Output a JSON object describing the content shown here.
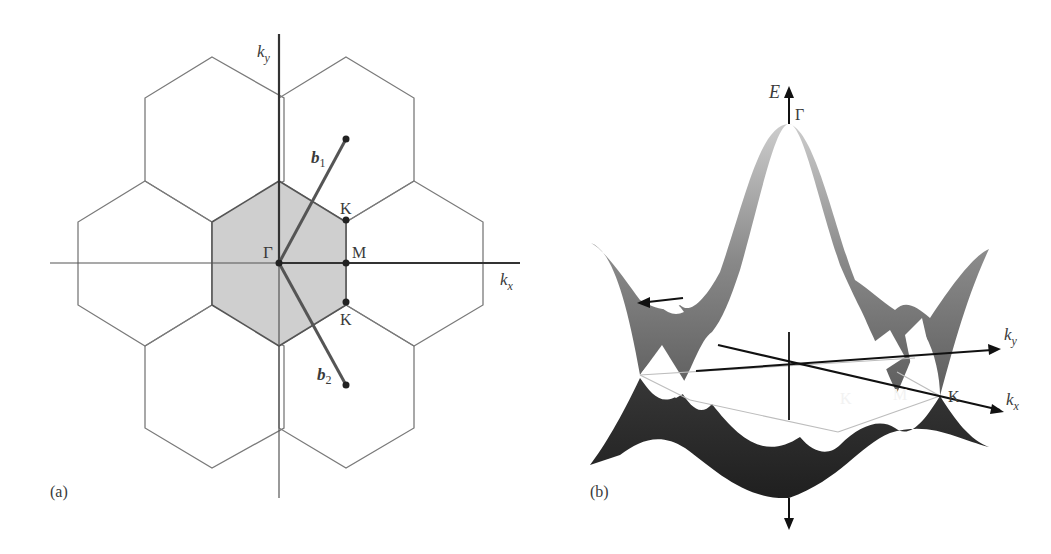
{
  "figure": {
    "panel_a": {
      "label": "(a)",
      "axes": {
        "x_label": "k",
        "x_sub": "x",
        "y_label": "k",
        "y_sub": "y"
      },
      "points": {
        "gamma": "Γ",
        "m": "M",
        "k_upper": "K",
        "k_lower": "K"
      },
      "vectors": [
        {
          "name": "b",
          "sub": "1"
        },
        {
          "name": "b",
          "sub": "2"
        }
      ],
      "colors": {
        "brillouin_zone_fill": "#cfcfcf",
        "hex_stroke": "#6e6e6e",
        "axis": "#333333",
        "vector": "#555555"
      }
    },
    "panel_b": {
      "label": "(b)",
      "axes": {
        "energy_label": "E",
        "x_label": "k",
        "x_sub": "x",
        "y_label": "k",
        "y_sub": "y"
      },
      "points": {
        "gamma": "Γ",
        "m": "M",
        "k_front": "K",
        "k_right": "K"
      },
      "colors": {
        "upper_band_top": "#cbcbcb",
        "upper_band_bottom": "#5e5e5e",
        "lower_band": "#272727"
      }
    }
  }
}
